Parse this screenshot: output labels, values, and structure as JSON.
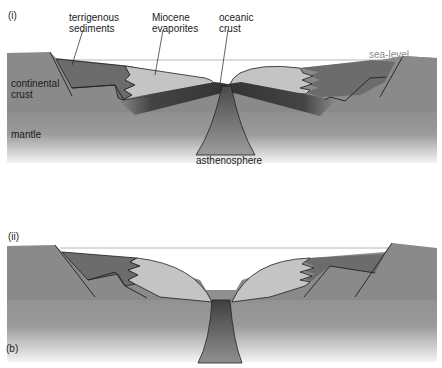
{
  "figure": {
    "part_label": "(b)",
    "panels": [
      {
        "id": "i",
        "label": "(i)",
        "annotations": {
          "terrigenous_sediments": "terrigenous\nsediments",
          "terrigenous_line1": "terrigenous",
          "terrigenous_line2": "sediments",
          "miocene_line1": "Miocene",
          "miocene_line2": "evaporites",
          "oceanic_line1": "oceanic",
          "oceanic_line2": "crust",
          "sea_level": "sea-level",
          "continental_line1": "continental",
          "continental_line2": "crust",
          "mantle": "mantle",
          "asthenosphere": "asthenosphere"
        }
      },
      {
        "id": "ii",
        "label": "(ii)"
      }
    ],
    "colors": {
      "continental_crust": "#8a8a8a",
      "sediments": "#6f6f6f",
      "evaporites": "#c4c4c4",
      "oceanic_crust": "#3e3e3e",
      "mantle_top": "#a0a0a0",
      "mantle_bottom": "#f2f2f2",
      "sea_level_line": "#b0b0b0",
      "outline": "#1f1f1f"
    }
  }
}
